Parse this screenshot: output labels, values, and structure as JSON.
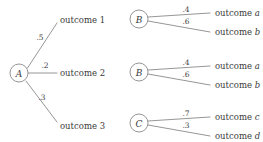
{
  "diagram": {
    "type": "probability-tree",
    "background_color": "#ffffff",
    "line_color": "#8a8a8a",
    "text_color": "#3a3a3a",
    "root": {
      "label": "A",
      "cx": 19,
      "cy": 73,
      "r": 9
    },
    "level1_branches": [
      {
        "probability": ".5",
        "prob_x": 40,
        "prob_y": 37,
        "outcome": "outcome 1",
        "outcome_x": 60,
        "outcome_y": 20,
        "line": {
          "x1": 27.5,
          "y1": 68,
          "x2": 57,
          "y2": 23
        }
      },
      {
        "probability": ".2",
        "prob_x": 45,
        "prob_y": 65,
        "outcome": "outcome 2",
        "outcome_x": 60,
        "outcome_y": 73,
        "line": {
          "x1": 28,
          "y1": 73,
          "x2": 57,
          "y2": 73
        }
      },
      {
        "probability": ".3",
        "prob_x": 42,
        "prob_y": 97,
        "outcome": "outcome 3",
        "outcome_x": 60,
        "outcome_y": 126,
        "line": {
          "x1": 26,
          "y1": 81,
          "x2": 57,
          "y2": 122
        }
      }
    ],
    "level2_nodes": [
      {
        "label": "B",
        "cx": 139,
        "cy": 19,
        "r": 9,
        "branches": [
          {
            "probability": ".4",
            "prob_x": 186,
            "prob_y": 9,
            "outcome_prefix": "outcome ",
            "outcome_italic": "a",
            "outcome_x": 215,
            "outcome_y": 13,
            "line": {
              "x1": 148,
              "y1": 17,
              "x2": 210,
              "y2": 13
            }
          },
          {
            "probability": ".6",
            "prob_x": 186,
            "prob_y": 21,
            "outcome_prefix": "outcome ",
            "outcome_italic": "b",
            "outcome_x": 215,
            "outcome_y": 32,
            "line": {
              "x1": 148,
              "y1": 21,
              "x2": 210,
              "y2": 32
            }
          }
        ]
      },
      {
        "label": "B",
        "cx": 139,
        "cy": 72,
        "r": 9,
        "branches": [
          {
            "probability": ".4",
            "prob_x": 186,
            "prob_y": 62,
            "outcome_prefix": "outcome ",
            "outcome_italic": "a",
            "outcome_x": 215,
            "outcome_y": 66,
            "line": {
              "x1": 148,
              "y1": 70,
              "x2": 210,
              "y2": 66
            }
          },
          {
            "probability": ".6",
            "prob_x": 186,
            "prob_y": 74,
            "outcome_prefix": "outcome ",
            "outcome_italic": "b",
            "outcome_x": 215,
            "outcome_y": 85,
            "line": {
              "x1": 148,
              "y1": 74,
              "x2": 210,
              "y2": 85
            }
          }
        ]
      },
      {
        "label": "C",
        "cx": 139,
        "cy": 123,
        "r": 9,
        "branches": [
          {
            "probability": ".7",
            "prob_x": 186,
            "prob_y": 113,
            "outcome_prefix": "outcome ",
            "outcome_italic": "c",
            "outcome_x": 215,
            "outcome_y": 117,
            "line": {
              "x1": 148,
              "y1": 121,
              "x2": 210,
              "y2": 117
            }
          },
          {
            "probability": ".3",
            "prob_x": 186,
            "prob_y": 125,
            "outcome_prefix": "outcome ",
            "outcome_italic": "d",
            "outcome_x": 215,
            "outcome_y": 136,
            "line": {
              "x1": 148,
              "y1": 125,
              "x2": 210,
              "y2": 136
            }
          }
        ]
      }
    ]
  }
}
